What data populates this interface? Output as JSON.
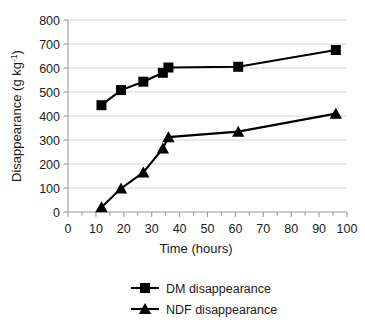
{
  "chart_data": {
    "type": "line",
    "title": "",
    "xlabel": "Time (hours)",
    "ylabel": "Disappearance (g kg",
    "ylabel_sup": "-1",
    "ylabel_tail": ")",
    "xlim": [
      0,
      100
    ],
    "ylim": [
      0,
      800
    ],
    "x_ticks": [
      0,
      10,
      20,
      30,
      40,
      50,
      60,
      70,
      80,
      90,
      100
    ],
    "x_tick_labels": [
      "0",
      "10",
      "20",
      "30",
      "40",
      "50",
      "60",
      "70",
      "80",
      "90",
      "100"
    ],
    "x_minor_tick_step": 5,
    "y_ticks": [
      0,
      100,
      200,
      300,
      400,
      500,
      600,
      700,
      800
    ],
    "y_tick_labels": [
      "0",
      "100",
      "200",
      "300",
      "400",
      "500",
      "600",
      "700",
      "800"
    ],
    "grid": "horizontal",
    "legend_position": "bottom",
    "series": [
      {
        "name": "DM disappearance",
        "marker": "square",
        "color": "#000000",
        "x": [
          12,
          19,
          27,
          34,
          36,
          61,
          96
        ],
        "values": [
          445,
          508,
          543,
          580,
          602,
          605,
          675
        ]
      },
      {
        "name": "NDF disappearance",
        "marker": "triangle",
        "color": "#000000",
        "x": [
          12,
          19,
          27,
          34,
          36,
          61,
          96
        ],
        "values": [
          20,
          98,
          165,
          265,
          312,
          335,
          410
        ]
      }
    ]
  },
  "legend": {
    "items": [
      {
        "label": "DM disappearance",
        "marker": "square"
      },
      {
        "label": "NDF  disappearance",
        "marker": "triangle"
      }
    ]
  }
}
